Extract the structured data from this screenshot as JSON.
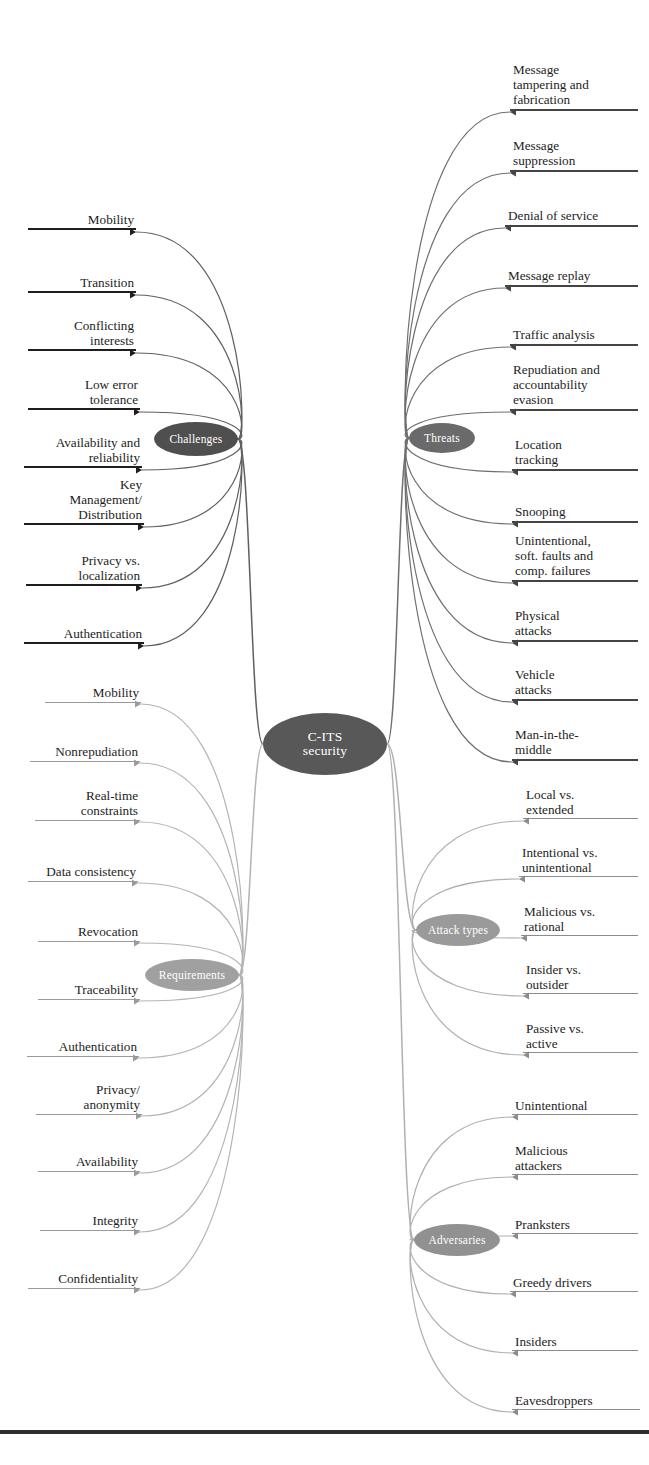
{
  "diagram": {
    "center": {
      "label": "C-ITS\nsecurity",
      "label_line1": "C-ITS",
      "label_line2": "security",
      "x": 325,
      "y": 744,
      "rx": 62,
      "ry": 31,
      "color": "#585858"
    },
    "bottom_rule": {
      "y": 1430,
      "height": 4,
      "color": "#2e2e2e"
    }
  },
  "branches": [
    {
      "id": "challenges",
      "label": "Challenges",
      "x": 196,
      "y": 439,
      "rx": 42,
      "ry": 17,
      "color": "#4f4f4f",
      "side": "left",
      "rule_color": "#1e1e1e",
      "rule_width": 2.6,
      "link_color": "#5f5f5f",
      "items": [
        {
          "label": "Mobility",
          "lines": [
            "Mobility"
          ],
          "x": 28,
          "y": 232,
          "width": 108
        },
        {
          "label": "Transition",
          "lines": [
            "Transition"
          ],
          "x": 28,
          "y": 295,
          "width": 108
        },
        {
          "label": "Conflicting interests",
          "lines": [
            "Conflicting",
            "interests"
          ],
          "x": 28,
          "y": 353,
          "width": 108
        },
        {
          "label": "Low error tolerance",
          "lines": [
            "Low error",
            "tolerance"
          ],
          "x": 28,
          "y": 412,
          "width": 112
        },
        {
          "label": "Availability and reliability",
          "lines": [
            "Availability and",
            "reliability"
          ],
          "x": 24,
          "y": 470,
          "width": 118
        },
        {
          "label": "Key Management/ Distribution",
          "lines": [
            "Key",
            "Management/",
            "Distribution"
          ],
          "x": 24,
          "y": 527,
          "width": 120
        },
        {
          "label": "Privacy vs. localization",
          "lines": [
            "Privacy vs.",
            "localization"
          ],
          "x": 26,
          "y": 588,
          "width": 116
        },
        {
          "label": "Authentication",
          "lines": [
            "Authentication"
          ],
          "x": 24,
          "y": 646,
          "width": 120
        }
      ]
    },
    {
      "id": "requirements",
      "label": "Requirements",
      "x": 192,
      "y": 975,
      "rx": 47,
      "ry": 16,
      "color": "#a0a0a0",
      "side": "left",
      "rule_color": "#9a9a9a",
      "rule_width": 1.5,
      "link_color": "#b4b4b4",
      "items": [
        {
          "label": "Mobility",
          "lines": [
            "Mobility"
          ],
          "x": 45,
          "y": 704,
          "width": 96
        },
        {
          "label": "Nonrepudiation",
          "lines": [
            "Nonrepudiation"
          ],
          "x": 30,
          "y": 763,
          "width": 110
        },
        {
          "label": "Real-time constraints",
          "lines": [
            "Real-time",
            "constraints"
          ],
          "x": 35,
          "y": 822,
          "width": 105
        },
        {
          "label": "Data consistency",
          "lines": [
            "Data consistency"
          ],
          "x": 28,
          "y": 883,
          "width": 110
        },
        {
          "label": "Revocation",
          "lines": [
            "Revocation"
          ],
          "x": 38,
          "y": 943,
          "width": 102
        },
        {
          "label": "Traceability",
          "lines": [
            "Traceability"
          ],
          "x": 38,
          "y": 1001,
          "width": 102
        },
        {
          "label": "Authentication",
          "lines": [
            "Authentication"
          ],
          "x": 27,
          "y": 1058,
          "width": 112
        },
        {
          "label": "Privacy/ anonymity",
          "lines": [
            "Privacy/",
            "anonymity"
          ],
          "x": 36,
          "y": 1116,
          "width": 106
        },
        {
          "label": "Availability",
          "lines": [
            "Availability"
          ],
          "x": 38,
          "y": 1173,
          "width": 102
        },
        {
          "label": "Integrity",
          "lines": [
            "Integrity"
          ],
          "x": 40,
          "y": 1232,
          "width": 100
        },
        {
          "label": "Confidentiality",
          "lines": [
            "Confidentiality"
          ],
          "x": 28,
          "y": 1290,
          "width": 112
        }
      ]
    },
    {
      "id": "threats",
      "label": "Threats",
      "x": 442,
      "y": 438,
      "rx": 33,
      "ry": 15,
      "color": "#6a6a6a",
      "side": "right",
      "rule_color": "#444444",
      "rule_width": 2.3,
      "link_color": "#6f6f6f",
      "items": [
        {
          "label": "Message tampering and fabrication",
          "lines": [
            "Message",
            "tampering and",
            "fabrication"
          ],
          "x": 510,
          "y": 112,
          "width": 128
        },
        {
          "label": "Message suppression",
          "lines": [
            "Message",
            "suppression"
          ],
          "x": 510,
          "y": 173,
          "width": 128
        },
        {
          "label": "Denial of service",
          "lines": [
            "Denial of service"
          ],
          "x": 505,
          "y": 228,
          "width": 133
        },
        {
          "label": "Message replay",
          "lines": [
            "Message replay"
          ],
          "x": 505,
          "y": 288,
          "width": 133
        },
        {
          "label": "Traffic analysis",
          "lines": [
            "Traffic analysis"
          ],
          "x": 510,
          "y": 347,
          "width": 128
        },
        {
          "label": "Repudiation and accountability evasion",
          "lines": [
            "Repudiation and",
            "accountability",
            "evasion"
          ],
          "x": 510,
          "y": 412,
          "width": 128
        },
        {
          "label": "Location tracking",
          "lines": [
            "Location",
            "tracking"
          ],
          "x": 512,
          "y": 472,
          "width": 126
        },
        {
          "label": "Snooping",
          "lines": [
            "Snooping"
          ],
          "x": 512,
          "y": 524,
          "width": 126
        },
        {
          "label": "Unintentional, soft. faults and comp. failures",
          "lines": [
            "Unintentional,",
            "soft. faults and",
            "comp. failures"
          ],
          "x": 512,
          "y": 583,
          "width": 126
        },
        {
          "label": "Physical attacks",
          "lines": [
            "Physical",
            "attacks"
          ],
          "x": 512,
          "y": 643,
          "width": 126
        },
        {
          "label": "Vehicle attacks",
          "lines": [
            "Vehicle",
            "attacks"
          ],
          "x": 512,
          "y": 702,
          "width": 126
        },
        {
          "label": "Man-in-the-middle",
          "lines": [
            "Man-in-the-",
            "middle"
          ],
          "x": 512,
          "y": 762,
          "width": 126
        }
      ]
    },
    {
      "id": "attack-types",
      "label": "Attack types",
      "x": 458,
      "y": 930,
      "rx": 42,
      "ry": 16,
      "color": "#9a9a9a",
      "side": "right",
      "rule_color": "#8c8c8c",
      "rule_width": 1.6,
      "link_color": "#b0b0b0",
      "items": [
        {
          "label": "Local vs. extended",
          "lines": [
            "Local vs.",
            "extended"
          ],
          "x": 523,
          "y": 821,
          "width": 115
        },
        {
          "label": "Intentional vs. unintentional",
          "lines": [
            "Intentional vs.",
            "unintentional"
          ],
          "x": 519,
          "y": 879,
          "width": 119
        },
        {
          "label": "Malicious vs. rational",
          "lines": [
            "Malicious vs.",
            "rational"
          ],
          "x": 521,
          "y": 938,
          "width": 117
        },
        {
          "label": "Insider vs. outsider",
          "lines": [
            "Insider vs.",
            "outsider"
          ],
          "x": 523,
          "y": 996,
          "width": 115
        },
        {
          "label": "Passive vs. active",
          "lines": [
            "Passive vs.",
            "active"
          ],
          "x": 523,
          "y": 1055,
          "width": 115
        }
      ]
    },
    {
      "id": "adversaries",
      "label": "Adversaries",
      "x": 457,
      "y": 1240,
      "rx": 43,
      "ry": 16,
      "color": "#919191",
      "side": "right",
      "rule_color": "#8c8c8c",
      "rule_width": 1.7,
      "link_color": "#b0b0b0",
      "items": [
        {
          "label": "Unintentional",
          "lines": [
            "Unintentional"
          ],
          "x": 512,
          "y": 1117,
          "width": 126
        },
        {
          "label": "Malicious attackers",
          "lines": [
            "Malicious",
            "attackers"
          ],
          "x": 512,
          "y": 1177,
          "width": 126
        },
        {
          "label": "Pranksters",
          "lines": [
            "Pranksters"
          ],
          "x": 512,
          "y": 1236,
          "width": 126
        },
        {
          "label": "Greedy drivers",
          "lines": [
            "Greedy drivers"
          ],
          "x": 510,
          "y": 1294,
          "width": 128
        },
        {
          "label": "Insiders",
          "lines": [
            "Insiders"
          ],
          "x": 512,
          "y": 1353,
          "width": 126
        },
        {
          "label": "Eavesdroppers",
          "lines": [
            "Eavesdroppers"
          ],
          "x": 512,
          "y": 1412,
          "width": 128
        }
      ]
    }
  ]
}
